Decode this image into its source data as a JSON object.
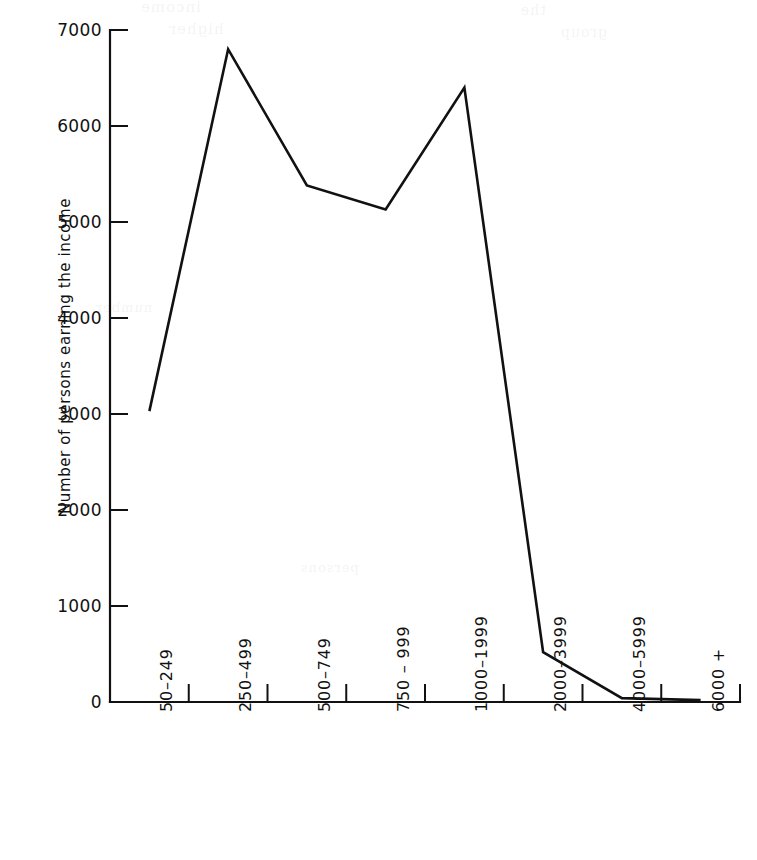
{
  "chart_data": {
    "type": "line",
    "title": "",
    "subtitle": "",
    "xlabel": "",
    "ylabel": "Number of persons earning the income",
    "categories": [
      "50–249",
      "250–499",
      "500–749",
      "750 – 999",
      "1000–1999",
      "2000–3999",
      "4000–5999",
      "6000 +"
    ],
    "values": [
      3030,
      6800,
      5380,
      5130,
      6400,
      520,
      40,
      20
    ],
    "series": [
      {
        "name": "Number of persons earning the income",
        "values": [
          3030,
          6800,
          5380,
          5130,
          6400,
          520,
          40,
          20
        ]
      }
    ],
    "ylim": [
      0,
      7000
    ],
    "ytick_values": [
      0,
      1000,
      2000,
      3000,
      4000,
      5000,
      6000,
      7000
    ],
    "ytick_labels": [
      "0",
      "1000",
      "2000",
      "3000",
      "4000",
      "5000",
      "6000",
      "7000"
    ],
    "grid": false,
    "legend": false,
    "legend_position": "none",
    "markers": false,
    "line_color": "#111111",
    "background_color": "#ffffff"
  },
  "figure": {
    "ghost_text": {
      "line_a": "income",
      "line_b": "higher",
      "line_c": "the",
      "line_d": "group",
      "line_e": "number",
      "line_f": "persons"
    }
  }
}
